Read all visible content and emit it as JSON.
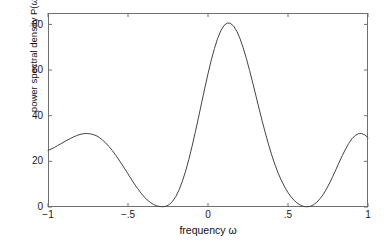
{
  "figure": {
    "background_color": "#ffffff",
    "axis_color": "#6f6f6f",
    "line_color": "#444444",
    "text_color": "#111111"
  },
  "chart_data": {
    "type": "line",
    "title": "",
    "subtitle": "",
    "xlabel": "frequency ω",
    "ylabel": "power spectral density P(ω)",
    "xlim": [
      -1,
      1
    ],
    "ylim": [
      0,
      85
    ],
    "xticks": [
      -1,
      -0.5,
      0,
      0.5,
      1
    ],
    "xticklabels": [
      "−1",
      "−.5",
      "0",
      ".5",
      "1"
    ],
    "yticks": [
      0,
      20,
      40,
      60,
      80
    ],
    "yticklabels": [
      "0",
      "20",
      "40",
      "60",
      "80"
    ],
    "grid": false,
    "legend": null,
    "legend_position": "none",
    "annotations": [],
    "series": [
      {
        "name": "P(ω)",
        "color": "#444444",
        "linewidth": 1,
        "x": [
          -1.0,
          -0.98,
          -0.96,
          -0.94,
          -0.92,
          -0.9,
          -0.88,
          -0.86,
          -0.84,
          -0.82,
          -0.8,
          -0.78,
          -0.76,
          -0.74,
          -0.72,
          -0.7,
          -0.68,
          -0.66,
          -0.64,
          -0.62,
          -0.6,
          -0.58,
          -0.56,
          -0.54,
          -0.52,
          -0.5,
          -0.48,
          -0.46,
          -0.44,
          -0.42,
          -0.4,
          -0.38,
          -0.36,
          -0.34,
          -0.32,
          -0.3,
          -0.28,
          -0.26,
          -0.24,
          -0.22,
          -0.2,
          -0.18,
          -0.16,
          -0.14,
          -0.12,
          -0.1,
          -0.08,
          -0.06,
          -0.04,
          -0.02,
          0.0,
          0.02,
          0.04,
          0.06,
          0.08,
          0.1,
          0.12,
          0.14,
          0.16,
          0.18,
          0.2,
          0.22,
          0.24,
          0.26,
          0.28,
          0.3,
          0.32,
          0.34,
          0.36,
          0.38,
          0.4,
          0.42,
          0.44,
          0.46,
          0.48,
          0.5,
          0.52,
          0.54,
          0.56,
          0.58,
          0.6,
          0.62,
          0.64,
          0.66,
          0.68,
          0.7,
          0.72,
          0.74,
          0.76,
          0.78,
          0.8,
          0.82,
          0.84,
          0.86,
          0.88,
          0.9,
          0.92,
          0.94,
          0.96,
          0.98,
          1.0
        ],
        "y": [
          24.8,
          25.4,
          26.1,
          26.9,
          27.7,
          28.5,
          29.3,
          30.0,
          30.7,
          31.3,
          31.8,
          32.1,
          32.2,
          32.1,
          31.8,
          31.3,
          30.5,
          29.4,
          28.1,
          26.6,
          24.9,
          23.0,
          21.0,
          18.9,
          16.7,
          14.5,
          12.3,
          10.1,
          8.1,
          6.2,
          4.5,
          3.1,
          2.0,
          1.1,
          0.5,
          0.2,
          0.1,
          0.4,
          1.2,
          2.6,
          4.7,
          7.6,
          11.3,
          15.7,
          20.8,
          26.5,
          32.6,
          39.0,
          45.6,
          52.1,
          58.4,
          64.2,
          69.4,
          73.8,
          77.2,
          79.5,
          80.6,
          80.5,
          79.3,
          77.0,
          73.8,
          69.7,
          65.0,
          59.8,
          54.3,
          48.6,
          42.9,
          37.3,
          32.0,
          27.0,
          22.4,
          18.3,
          14.6,
          11.4,
          8.7,
          6.3,
          4.4,
          2.8,
          1.6,
          0.7,
          0.2,
          0.1,
          0.3,
          1.0,
          2.1,
          3.6,
          5.5,
          7.8,
          10.5,
          13.4,
          16.5,
          19.6,
          22.6,
          25.4,
          27.9,
          29.9,
          31.3,
          32.1,
          32.2,
          31.6,
          30.4
        ]
      }
    ],
    "features": {
      "peak_value": 80.6,
      "peak_position": 0.0,
      "null_positions": [
        -0.29,
        0.41
      ],
      "sidelobe_peaks": [
        -0.76,
        0.96
      ],
      "sidelobe_values": [
        32.2,
        32.2
      ],
      "edge_values": [
        24.8,
        30.4
      ]
    }
  }
}
